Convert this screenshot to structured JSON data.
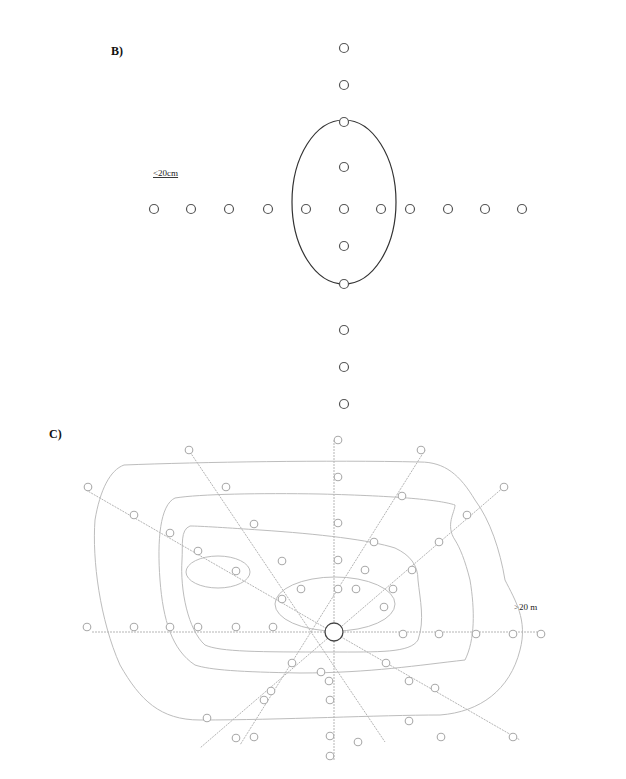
{
  "panels": {
    "b": {
      "label": "B)",
      "scale_label": "<20cm",
      "description": "Cross-shaped sampling grid; central ellipse encloses the inner points",
      "horizontal_points": 11,
      "vertical_points": 11
    },
    "c": {
      "label": "C)",
      "scale_label": ">20 m",
      "description": "Radial transects from a central point with concentric contour lines",
      "transect_count": 8
    }
  },
  "colors": {
    "point_stroke": "#555555",
    "ellipse": "#333333",
    "contour": "#bdbdbd",
    "transect": "#b5b5b5"
  }
}
